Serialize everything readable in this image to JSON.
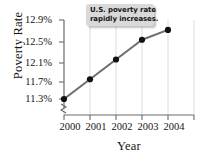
{
  "chart_data": {
    "type": "line",
    "title": "",
    "xlabel": "Year",
    "ylabel": "Poverty Rate",
    "x": [
      2000,
      2001,
      2002,
      2003,
      2004
    ],
    "categories": [
      "2000",
      "2001",
      "2002",
      "2003",
      "2004"
    ],
    "values": [
      11.3,
      11.7,
      12.1,
      12.5,
      12.7
    ],
    "xtick_labels": [
      "2000",
      "2001",
      "2002",
      "2003",
      "2004"
    ],
    "ytick_labels": [
      "11.3%",
      "11.7%",
      "12.1%",
      "12.5%",
      "12.9%"
    ],
    "ytick_values": [
      11.3,
      11.7,
      12.1,
      12.5,
      12.9
    ],
    "ylim": [
      11.3,
      12.9
    ],
    "xlim": [
      2000,
      2004
    ],
    "y_axis_break": true,
    "grid": "vertical",
    "legend": "none",
    "annotations": [
      {
        "name": "callout",
        "lines": [
          "U.S. poverty rate",
          "rapidly increases."
        ]
      }
    ],
    "series_color": "#6e6e6e",
    "marker_color": "#111111",
    "axis_color": "#6b6b6b",
    "grid_color": "#dcdcdc",
    "callout_bg": "#d9d9d9",
    "text_color": "#141414"
  }
}
